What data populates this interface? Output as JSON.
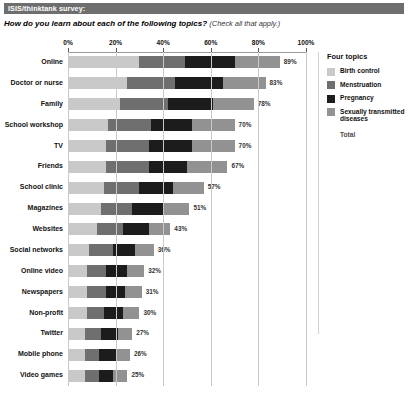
{
  "header": {
    "banner": "ISIS/thinktank survey:",
    "question": "How do you learn about each of the following topics?",
    "instruction": "(Check all that apply.)"
  },
  "legend": {
    "title": "Four topics",
    "total_label": "Total",
    "items": [
      {
        "label": "Birth control",
        "color": "#c9c9c9"
      },
      {
        "label": "Menstruation",
        "color": "#6f6f6f"
      },
      {
        "label": "Pregnancy",
        "color": "#1c1c1c"
      },
      {
        "label": "Sexually transmitted diseases",
        "color": "#929292"
      }
    ]
  },
  "chart_data": {
    "type": "bar",
    "orientation": "horizontal",
    "stacked": true,
    "title": "How do you learn about each of the following topics?",
    "xlabel": "",
    "ylabel": "",
    "xlim": [
      0,
      100
    ],
    "grid": true,
    "legend_position": "right",
    "xticks": [
      0,
      20,
      40,
      60,
      80,
      100
    ],
    "xticklabels": [
      "0%",
      "20%",
      "40%",
      "60%",
      "80%",
      "100%"
    ],
    "series": [
      {
        "name": "Birth control",
        "color": "#c9c9c9",
        "values": [
          30,
          25,
          22,
          17,
          16,
          16,
          15,
          14,
          12,
          9,
          8,
          8,
          8,
          7,
          7,
          7
        ]
      },
      {
        "name": "Menstruation",
        "color": "#6f6f6f",
        "values": [
          19,
          20,
          20,
          18,
          18,
          18,
          15,
          13,
          11,
          10,
          8,
          8,
          7,
          7,
          6,
          6
        ]
      },
      {
        "name": "Pregnancy",
        "color": "#1c1c1c",
        "values": [
          21,
          20,
          19,
          17,
          18,
          16,
          14,
          13,
          11,
          9,
          9,
          8,
          8,
          7,
          7,
          6
        ]
      },
      {
        "name": "Sexually transmitted diseases",
        "color": "#929292",
        "values": [
          19,
          18,
          17,
          18,
          18,
          17,
          13,
          11,
          9,
          8,
          7,
          7,
          7,
          6,
          6,
          6
        ]
      }
    ],
    "categories": [
      "Online",
      "Doctor or nurse",
      "Family",
      "School workshop",
      "TV",
      "Friends",
      "School clinic",
      "Magazines",
      "Websites",
      "Social networks",
      "Online video",
      "Newspapers",
      "Non-profit",
      "Twitter",
      "Mobile phone",
      "Video games"
    ],
    "totals": [
      89,
      83,
      78,
      70,
      70,
      67,
      57,
      51,
      43,
      36,
      32,
      31,
      30,
      27,
      26,
      25
    ],
    "total_labels": [
      "89%",
      "83%",
      "78%",
      "70%",
      "70%",
      "67%",
      "57%",
      "51%",
      "43%",
      "36%",
      "32%",
      "31%",
      "30%",
      "27%",
      "26%",
      "25%"
    ]
  }
}
